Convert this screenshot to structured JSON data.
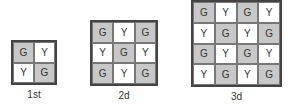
{
  "colors": {
    "G": "#c8c8c8",
    "Y": "#ffffff",
    "border": "#444444"
  },
  "generations": [
    {
      "label": "1st",
      "grid": [
        [
          "G",
          "Y"
        ],
        [
          "Y",
          "G"
        ]
      ]
    },
    {
      "label": "2d",
      "grid": [
        [
          "G",
          "Y",
          "G"
        ],
        [
          "Y",
          "G",
          "Y"
        ],
        [
          "G",
          "Y",
          "G"
        ]
      ]
    },
    {
      "label": "3d",
      "grid": [
        [
          "G",
          "Y",
          "G",
          "Y"
        ],
        [
          "Y",
          "G",
          "Y",
          "G"
        ],
        [
          "G",
          "Y",
          "G",
          "Y"
        ],
        [
          "Y",
          "G",
          "Y",
          "G"
        ]
      ]
    }
  ]
}
